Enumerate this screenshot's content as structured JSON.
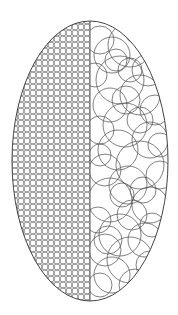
{
  "figure": {
    "description": "Ellipse split vertically: left half filled with a uniform grid of small circles, right half filled with large overlapping random circles",
    "stroke_color": "#555555",
    "outline_color": "#444444",
    "background": "#ffffff"
  },
  "ellipse": {
    "cx": 90,
    "cy": 161,
    "rx": 78,
    "ry": 140
  },
  "divider": {
    "x": 90
  },
  "left_pattern": {
    "type": "uniform-small-circles",
    "cell": 6,
    "radius": 3.1,
    "stroke_width": 0.6
  },
  "right_pattern": {
    "type": "overlapping-large-circles",
    "stroke_width": 0.75,
    "circles": [
      [
        112,
        55,
        18
      ],
      [
        130,
        45,
        22
      ],
      [
        148,
        70,
        16
      ],
      [
        120,
        80,
        24
      ],
      [
        100,
        40,
        14
      ],
      [
        140,
        95,
        20
      ],
      [
        110,
        105,
        17
      ],
      [
        155,
        110,
        15
      ],
      [
        125,
        125,
        22
      ],
      [
        100,
        130,
        14
      ],
      [
        150,
        140,
        18
      ],
      [
        118,
        150,
        20
      ],
      [
        140,
        165,
        24
      ],
      [
        105,
        170,
        16
      ],
      [
        160,
        175,
        14
      ],
      [
        128,
        185,
        19
      ],
      [
        110,
        200,
        22
      ],
      [
        150,
        205,
        18
      ],
      [
        132,
        215,
        15
      ],
      [
        98,
        220,
        13
      ],
      [
        120,
        235,
        21
      ],
      [
        145,
        240,
        17
      ],
      [
        105,
        250,
        16
      ],
      [
        130,
        260,
        23
      ],
      [
        150,
        265,
        14
      ],
      [
        112,
        275,
        18
      ],
      [
        135,
        285,
        16
      ],
      [
        100,
        285,
        12
      ],
      [
        160,
        145,
        12
      ],
      [
        95,
        75,
        12
      ],
      [
        138,
        30,
        14
      ],
      [
        122,
        195,
        12
      ],
      [
        140,
        120,
        13
      ],
      [
        116,
        60,
        11
      ],
      [
        152,
        225,
        12
      ],
      [
        126,
        100,
        14
      ],
      [
        108,
        240,
        14
      ],
      [
        143,
        190,
        13
      ],
      [
        100,
        155,
        11
      ],
      [
        130,
        70,
        12
      ]
    ]
  }
}
